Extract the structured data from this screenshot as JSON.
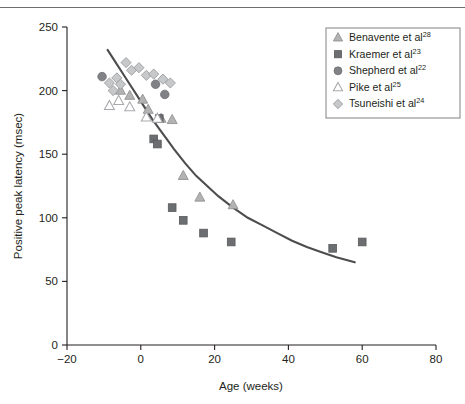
{
  "figure": {
    "background": "#ffffff",
    "top_rule_color": "#6d6e71"
  },
  "chart_data": {
    "type": "scatter",
    "title": "",
    "xlabel": "Age (weeks)",
    "ylabel": "Positive peak latency (msec)",
    "xlim": [
      -20,
      80
    ],
    "ylim": [
      0,
      250
    ],
    "xticks": [
      -20,
      0,
      20,
      40,
      60,
      80
    ],
    "yticks": [
      0,
      50,
      100,
      150,
      200,
      250
    ],
    "xticklabels": [
      "−20",
      "0",
      "20",
      "40",
      "60",
      "80"
    ],
    "yticklabels": [
      "0",
      "50",
      "100",
      "150",
      "200",
      "250"
    ],
    "grid": false,
    "legend_position": "top-right",
    "series": [
      {
        "name": "Benavente et al",
        "ref": "28",
        "marker": "triangle-filled",
        "color": "#b3b3b3",
        "edge": "#8c8c8c",
        "points": [
          {
            "x": -5.5,
            "y": 200
          },
          {
            "x": -3.0,
            "y": 196
          },
          {
            "x": 0.5,
            "y": 193
          },
          {
            "x": 2.0,
            "y": 185
          },
          {
            "x": 5.5,
            "y": 178
          },
          {
            "x": 8.5,
            "y": 177
          },
          {
            "x": 11.5,
            "y": 133
          },
          {
            "x": 16.0,
            "y": 116
          },
          {
            "x": 25.0,
            "y": 110
          }
        ]
      },
      {
        "name": "Kraemer et al",
        "ref": "23",
        "marker": "square-filled",
        "color": "#6d6e71",
        "edge": "#58595b",
        "points": [
          {
            "x": 5.0,
            "y": 178
          },
          {
            "x": 3.5,
            "y": 162
          },
          {
            "x": 4.5,
            "y": 158
          },
          {
            "x": 8.5,
            "y": 108
          },
          {
            "x": 11.5,
            "y": 98
          },
          {
            "x": 17.0,
            "y": 88
          },
          {
            "x": 24.5,
            "y": 81
          },
          {
            "x": 52.0,
            "y": 76
          },
          {
            "x": 60.0,
            "y": 81
          }
        ]
      },
      {
        "name": "Shepherd et al",
        "ref": "22",
        "marker": "circle-filled",
        "color": "#808285",
        "edge": "#6d6e71",
        "points": [
          {
            "x": -10.5,
            "y": 211
          },
          {
            "x": 4.0,
            "y": 205
          },
          {
            "x": 6.5,
            "y": 197
          }
        ]
      },
      {
        "name": "Pike et al",
        "ref": "25",
        "marker": "triangle-open",
        "color": "#ffffff",
        "edge": "#a7a9ac",
        "points": [
          {
            "x": -8.5,
            "y": 188
          },
          {
            "x": -6.0,
            "y": 192
          },
          {
            "x": -3.0,
            "y": 187
          },
          {
            "x": 1.5,
            "y": 179
          },
          {
            "x": 4.5,
            "y": 178
          }
        ]
      },
      {
        "name": "Tsuneishi et al",
        "ref": "24",
        "marker": "diamond",
        "color": "#c7c8ca",
        "edge": "#939598",
        "points": [
          {
            "x": -8.5,
            "y": 206
          },
          {
            "x": -7.5,
            "y": 200
          },
          {
            "x": -6.5,
            "y": 210
          },
          {
            "x": -5.5,
            "y": 205
          },
          {
            "x": -4.0,
            "y": 222
          },
          {
            "x": -2.5,
            "y": 216
          },
          {
            "x": -0.5,
            "y": 218
          },
          {
            "x": 1.5,
            "y": 212
          },
          {
            "x": 3.5,
            "y": 213
          },
          {
            "x": 6.0,
            "y": 209
          },
          {
            "x": 8.0,
            "y": 206
          }
        ]
      }
    ],
    "fit_curve": {
      "name": "fitted-decay-curve",
      "color": "#4d4d4f",
      "points": [
        {
          "x": -9.0,
          "y": 232
        },
        {
          "x": -7.0,
          "y": 223
        },
        {
          "x": -5.0,
          "y": 214
        },
        {
          "x": -3.0,
          "y": 205
        },
        {
          "x": -1.0,
          "y": 196
        },
        {
          "x": 1.0,
          "y": 187
        },
        {
          "x": 3.0,
          "y": 178
        },
        {
          "x": 5.0,
          "y": 170
        },
        {
          "x": 7.0,
          "y": 162
        },
        {
          "x": 9.0,
          "y": 154
        },
        {
          "x": 12.0,
          "y": 143
        },
        {
          "x": 15.0,
          "y": 133
        },
        {
          "x": 18.0,
          "y": 125
        },
        {
          "x": 21.0,
          "y": 117
        },
        {
          "x": 25.0,
          "y": 108
        },
        {
          "x": 29.0,
          "y": 100
        },
        {
          "x": 33.0,
          "y": 94
        },
        {
          "x": 37.0,
          "y": 88
        },
        {
          "x": 41.0,
          "y": 82
        },
        {
          "x": 45.0,
          "y": 77
        },
        {
          "x": 49.0,
          "y": 73
        },
        {
          "x": 53.0,
          "y": 69
        },
        {
          "x": 58.0,
          "y": 65
        }
      ]
    },
    "legend": [
      {
        "label": "Benavente et al",
        "ref": "28",
        "marker": "triangle-filled"
      },
      {
        "label": "Kraemer et al",
        "ref": "23",
        "marker": "square-filled"
      },
      {
        "label": "Shepherd et al",
        "ref": "22",
        "marker": "circle-filled"
      },
      {
        "label": "Pike et al",
        "ref": "25",
        "marker": "triangle-open"
      },
      {
        "label": "Tsuneishi et al",
        "ref": "24",
        "marker": "diamond"
      }
    ]
  }
}
